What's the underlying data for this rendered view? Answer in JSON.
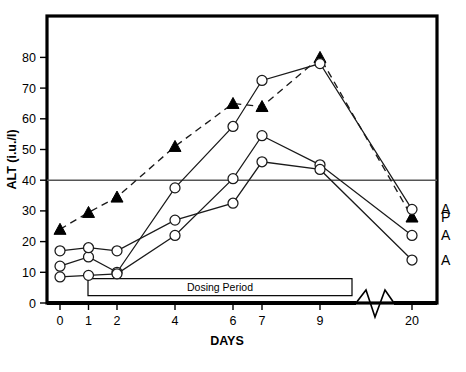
{
  "chart_data": {
    "type": "line",
    "title": "",
    "xlabel": "DAYS",
    "ylabel": "ALT (i.u./l)",
    "x": [
      0,
      1,
      2,
      4,
      6,
      7,
      9,
      20
    ],
    "xtick_labels": [
      "0",
      "1",
      "2",
      "4",
      "6",
      "7",
      "9",
      "20"
    ],
    "ytick_labels": [
      "0",
      "10",
      "20",
      "30",
      "40",
      "50",
      "60",
      "70",
      "80"
    ],
    "yticks": [
      0,
      10,
      20,
      30,
      40,
      50,
      60,
      70,
      80
    ],
    "ylim": [
      0,
      85
    ],
    "grid": false,
    "legend_position": "right-inline",
    "axis_break": {
      "between": [
        9,
        20
      ],
      "style": "zigzag",
      "axis": "x"
    },
    "reference_line": {
      "value": 40,
      "label": "",
      "style": "solid"
    },
    "annotations": [
      {
        "text": "Dosing Period",
        "type": "span-box",
        "x_start": 1,
        "x_end": 10.2,
        "y": 5
      }
    ],
    "series": [
      {
        "name": "P",
        "end_label": "P",
        "marker": "filled-triangle",
        "line_style": "dashed",
        "values": [
          24,
          29.5,
          34.5,
          51,
          65,
          64,
          80,
          28
        ]
      },
      {
        "name": "A1",
        "end_label": "A",
        "marker": "open-circle",
        "line_style": "solid",
        "values": [
          12,
          15,
          10,
          37.5,
          57.5,
          72.5,
          78,
          30.5
        ]
      },
      {
        "name": "A2",
        "end_label": "A",
        "marker": "open-circle",
        "line_style": "solid",
        "values": [
          8.5,
          9,
          9.5,
          22,
          40.5,
          54.5,
          45,
          22
        ]
      },
      {
        "name": "A3",
        "end_label": "A",
        "marker": "open-circle",
        "line_style": "solid",
        "values": [
          17,
          18,
          17,
          27,
          32.5,
          46,
          43.5,
          14
        ]
      }
    ],
    "colors": {
      "axis": "#000000",
      "line": "#1a1a1a",
      "marker_fill": "#ffffff",
      "triangle_fill": "#000000",
      "reference_line": "#555555",
      "background": "#ffffff"
    }
  }
}
